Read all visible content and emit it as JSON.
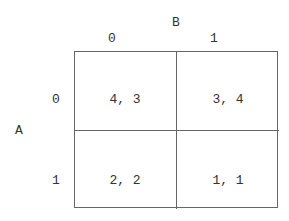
{
  "player_col": {
    "name": "B",
    "strategies": [
      "0",
      "1"
    ]
  },
  "player_row": {
    "name": "A",
    "strategies": [
      "0",
      "1"
    ]
  },
  "payoffs": [
    [
      "4, 3",
      "3, 4"
    ],
    [
      "2, 2",
      "1, 1"
    ]
  ]
}
